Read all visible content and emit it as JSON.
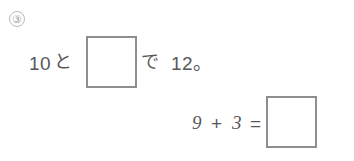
{
  "worksheet": {
    "problem_number": "③",
    "statement": {
      "number_first": "10",
      "particle_to": "と",
      "particle_te": "で",
      "number_total": "12。",
      "blank_placeholder": ""
    },
    "equation": {
      "operand_left": "9",
      "operator": "+",
      "operand_right": "3",
      "equals": "=",
      "blank_placeholder": ""
    },
    "colors": {
      "page_background": "#ffffff",
      "text": "#57575a",
      "box_border": "#8e8e92",
      "problem_number_text": "#9d9da1",
      "problem_number_circle": "#b9b9bc"
    }
  }
}
